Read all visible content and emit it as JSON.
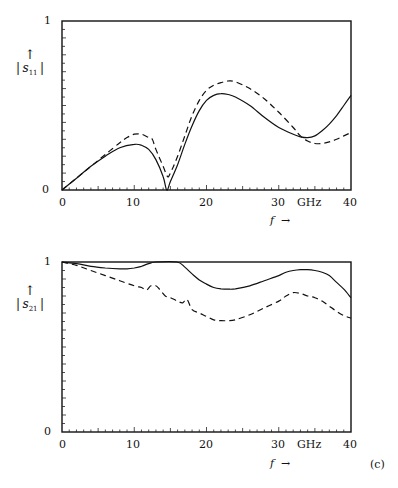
{
  "figure_label": "(c)",
  "chart_data": [
    {
      "type": "line",
      "title": "",
      "ylabel": "|s11|",
      "ylabel_sub": "11",
      "xlabel": "f",
      "x_unit": "GHz",
      "xlim": [
        0,
        40
      ],
      "ylim": [
        0,
        1
      ],
      "x_ticks": [
        0,
        10,
        20,
        30,
        40
      ],
      "x_tick_labels": [
        "0",
        "10",
        "20",
        "30",
        "40"
      ],
      "y_tick_labels": [
        "0",
        "1"
      ],
      "grid": false,
      "series": [
        {
          "name": "solid",
          "style": "solid",
          "points": [
            [
              0,
              0
            ],
            [
              2,
              0.07
            ],
            [
              4,
              0.14
            ],
            [
              6,
              0.2
            ],
            [
              8,
              0.25
            ],
            [
              10,
              0.27
            ],
            [
              11,
              0.265
            ],
            [
              12,
              0.24
            ],
            [
              13,
              0.18
            ],
            [
              14,
              0.08
            ],
            [
              14.5,
              0.0
            ],
            [
              15,
              0.05
            ],
            [
              16,
              0.15
            ],
            [
              17,
              0.27
            ],
            [
              18,
              0.38
            ],
            [
              19,
              0.47
            ],
            [
              20,
              0.53
            ],
            [
              21,
              0.56
            ],
            [
              22,
              0.57
            ],
            [
              23,
              0.565
            ],
            [
              24,
              0.55
            ],
            [
              26,
              0.5
            ],
            [
              28,
              0.43
            ],
            [
              30,
              0.37
            ],
            [
              32,
              0.33
            ],
            [
              33,
              0.315
            ],
            [
              34,
              0.31
            ],
            [
              35,
              0.32
            ],
            [
              36,
              0.35
            ],
            [
              37,
              0.39
            ],
            [
              38,
              0.44
            ],
            [
              39,
              0.5
            ],
            [
              40,
              0.56
            ]
          ]
        },
        {
          "name": "dashed",
          "style": "dashed",
          "points": [
            [
              0,
              0
            ],
            [
              2,
              0.07
            ],
            [
              4,
              0.14
            ],
            [
              6,
              0.21
            ],
            [
              8,
              0.28
            ],
            [
              9,
              0.31
            ],
            [
              10,
              0.33
            ],
            [
              11,
              0.33
            ],
            [
              12,
              0.31
            ],
            [
              12.5,
              0.3
            ],
            [
              13,
              0.24
            ],
            [
              14,
              0.14
            ],
            [
              14.6,
              0.08
            ],
            [
              15,
              0.1
            ],
            [
              16,
              0.2
            ],
            [
              17,
              0.32
            ],
            [
              18,
              0.44
            ],
            [
              19,
              0.53
            ],
            [
              20,
              0.59
            ],
            [
              21,
              0.62
            ],
            [
              22,
              0.635
            ],
            [
              23,
              0.645
            ],
            [
              24,
              0.64
            ],
            [
              26,
              0.6
            ],
            [
              28,
              0.54
            ],
            [
              30,
              0.46
            ],
            [
              32,
              0.37
            ],
            [
              33,
              0.32
            ],
            [
              34,
              0.29
            ],
            [
              35,
              0.275
            ],
            [
              36,
              0.275
            ],
            [
              37,
              0.285
            ],
            [
              38,
              0.3
            ],
            [
              39,
              0.32
            ],
            [
              40,
              0.34
            ]
          ]
        }
      ]
    },
    {
      "type": "line",
      "title": "",
      "ylabel": "|s21|",
      "ylabel_sub": "21",
      "xlabel": "f",
      "x_unit": "GHz",
      "xlim": [
        0,
        40
      ],
      "ylim": [
        0,
        1
      ],
      "x_ticks": [
        0,
        10,
        20,
        30,
        40
      ],
      "x_tick_labels": [
        "0",
        "10",
        "20",
        "30",
        "40"
      ],
      "y_tick_labels": [
        "0",
        "1"
      ],
      "grid": false,
      "series": [
        {
          "name": "solid",
          "style": "solid",
          "points": [
            [
              0,
              1
            ],
            [
              2,
              0.99
            ],
            [
              4,
              0.975
            ],
            [
              6,
              0.965
            ],
            [
              8,
              0.96
            ],
            [
              9,
              0.96
            ],
            [
              10,
              0.965
            ],
            [
              11,
              0.975
            ],
            [
              12,
              0.99
            ],
            [
              13,
              1.0
            ],
            [
              15.9,
              1.0
            ],
            [
              17,
              0.97
            ],
            [
              18,
              0.93
            ],
            [
              19,
              0.895
            ],
            [
              20,
              0.87
            ],
            [
              21,
              0.85
            ],
            [
              22,
              0.842
            ],
            [
              23,
              0.84
            ],
            [
              24,
              0.842
            ],
            [
              26,
              0.86
            ],
            [
              28,
              0.89
            ],
            [
              30,
              0.92
            ],
            [
              31,
              0.94
            ],
            [
              32,
              0.95
            ],
            [
              33,
              0.955
            ],
            [
              34,
              0.955
            ],
            [
              35,
              0.95
            ],
            [
              36,
              0.94
            ],
            [
              37,
              0.92
            ],
            [
              38,
              0.88
            ],
            [
              39,
              0.84
            ],
            [
              40,
              0.79
            ]
          ]
        },
        {
          "name": "dashed",
          "style": "dashed",
          "points": [
            [
              0,
              1
            ],
            [
              2,
              0.98
            ],
            [
              4,
              0.95
            ],
            [
              6,
              0.92
            ],
            [
              8,
              0.89
            ],
            [
              10,
              0.86
            ],
            [
              11,
              0.85
            ],
            [
              11.7,
              0.835
            ],
            [
              12.3,
              0.86
            ],
            [
              13,
              0.86
            ],
            [
              13.5,
              0.84
            ],
            [
              14.3,
              0.8
            ],
            [
              15,
              0.79
            ],
            [
              16,
              0.77
            ],
            [
              16.7,
              0.76
            ],
            [
              17.3,
              0.78
            ],
            [
              18,
              0.72
            ],
            [
              19,
              0.7
            ],
            [
              20,
              0.68
            ],
            [
              21,
              0.66
            ],
            [
              22,
              0.655
            ],
            [
              23,
              0.655
            ],
            [
              24,
              0.66
            ],
            [
              26,
              0.69
            ],
            [
              28,
              0.73
            ],
            [
              30,
              0.77
            ],
            [
              31,
              0.8
            ],
            [
              32,
              0.82
            ],
            [
              33,
              0.815
            ],
            [
              34,
              0.8
            ],
            [
              35,
              0.79
            ],
            [
              36,
              0.77
            ],
            [
              37,
              0.74
            ],
            [
              38,
              0.71
            ],
            [
              39,
              0.685
            ],
            [
              40,
              0.67
            ]
          ]
        }
      ]
    }
  ],
  "plots": [
    {
      "y_top_label": "1",
      "y_bottom_label": "0",
      "x_tick_labels": [
        "0",
        "10",
        "20",
        "30",
        "40"
      ],
      "unit_label": "GHz",
      "xlabel": "f",
      "xlabel_arrow": "→",
      "ylabel_arrow": "↑",
      "ylabel_main": "s",
      "ylabel_sub": "11"
    },
    {
      "y_top_label": "1",
      "y_bottom_label": "0",
      "x_tick_labels": [
        "0",
        "10",
        "20",
        "30",
        "40"
      ],
      "unit_label": "GHz",
      "xlabel": "f",
      "xlabel_arrow": "→",
      "ylabel_arrow": "↑",
      "ylabel_main": "s",
      "ylabel_sub": "21"
    }
  ]
}
